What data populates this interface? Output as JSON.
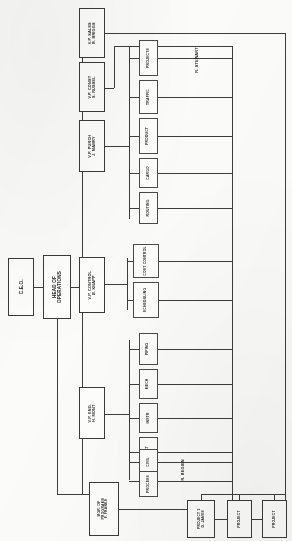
{
  "document": {
    "type": "organization-chart",
    "orientation": "rotated-90-counterclockwise",
    "title": "Corporate Organization Chart",
    "ink_color": "#3a3a3a",
    "paper_color": "#fbfbfa"
  },
  "executive": {
    "ceo": {
      "line1": "C.E.O.",
      "line2": ""
    },
    "head_of_operations": {
      "line1": "HEAD OF",
      "line2": "OPERATIONS"
    }
  },
  "vice_presidents": [
    {
      "id": "vp-sales",
      "line1": "V.P. SALES",
      "line2": "B. BRIGGS"
    },
    {
      "id": "vp-const",
      "line1": "V.P. CONST",
      "line2": "S. RUSSEL"
    },
    {
      "id": "vp-purch",
      "line1": "V.P. PURCH",
      "line2": "J. MABRY"
    },
    {
      "id": "vp-control",
      "line1": "V.P. CONTROL",
      "line2": "B. KNAPP"
    },
    {
      "id": "vp-eng",
      "line1": "V.P. ENG.",
      "line2": "H. MONT"
    }
  ],
  "program_manager": {
    "line1": "MGR. OF",
    "line2": "PROGRAMS",
    "line3": "F. FRANKS"
  },
  "purchasing_functions": [
    {
      "id": "fn-projects",
      "label": "PROJECTS"
    },
    {
      "id": "fn-traffic",
      "label": "TRAFFIC"
    },
    {
      "id": "fn-product",
      "label": "PRODUCT"
    },
    {
      "id": "fn-cargo",
      "label": "CARGO"
    },
    {
      "id": "fn-routing",
      "label": "ROUTING"
    }
  ],
  "control_functions": [
    {
      "id": "fn-cost-control",
      "label": "COST CONTROL"
    },
    {
      "id": "fn-scheduling",
      "label": "SCHEDULING"
    }
  ],
  "engineering_functions": [
    {
      "id": "fn-piping",
      "label": "PIPING"
    },
    {
      "id": "fn-mech",
      "label": "MECH"
    },
    {
      "id": "fn-instr",
      "label": "INSTR"
    },
    {
      "id": "fn-elect",
      "label": "ELECT"
    },
    {
      "id": "fn-civil",
      "label": "CIVIL"
    },
    {
      "id": "fn-process",
      "label": "PROCESS"
    }
  ],
  "projects": [
    {
      "id": "project-1",
      "line1": "PROJECT 1",
      "line2": "D. JAMES"
    },
    {
      "id": "project-2",
      "line1": "PROJECT",
      "line2": ""
    },
    {
      "id": "project-3",
      "line1": "PROJECT",
      "line2": ""
    }
  ],
  "annotations": [
    {
      "id": "annot-stewart",
      "label": "R. STEWART"
    },
    {
      "id": "annot-begien",
      "label": "R. BEGIEN"
    }
  ]
}
